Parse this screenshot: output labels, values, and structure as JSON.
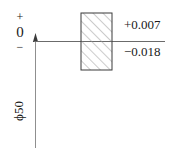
{
  "diagram": {
    "type": "tolerance-zone-diagram",
    "title": "",
    "axis": {
      "plus_sign": "+",
      "zero_label": "0",
      "minus_sign": "−"
    },
    "deviations": {
      "upper": "+0.007",
      "lower": "−0.018"
    },
    "dimension": {
      "label": "ϕ50",
      "nominal_size": 50,
      "symbol": "ϕ"
    },
    "tolerance_zone": {
      "upper_value": 0.007,
      "lower_value": -0.018,
      "hatching": "45-degree-diagonal",
      "fill_color": "#ffffff",
      "stroke_color": "#3a3a3a"
    },
    "colors": {
      "line": "#6b6b6b",
      "zero_line": "#6b6b6b",
      "text": "#1a1a1a",
      "hatch": "#9a9a9a",
      "background": "#ffffff"
    }
  }
}
